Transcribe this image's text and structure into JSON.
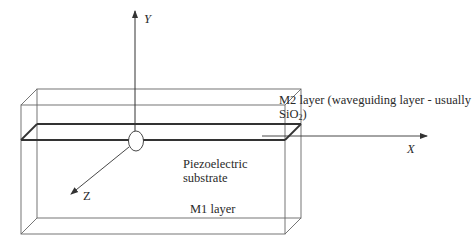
{
  "diagram": {
    "title": "",
    "axes": {
      "y_label": "Y",
      "x_label": "X",
      "z_label": "Z"
    },
    "labels": {
      "m2_layer_line1": "M2 layer (waveguiding layer - usually",
      "m2_layer_line2_prefix": "SiO",
      "m2_layer_line2_sub": "2",
      "m2_layer_line2_suffix": ")",
      "substrate_line1": "Piezoelectric",
      "substrate_line2": "substrate",
      "m1_layer": "M1 layer"
    },
    "colors": {
      "line": "#555555",
      "thick_line": "#333333",
      "background": "#ffffff"
    }
  }
}
